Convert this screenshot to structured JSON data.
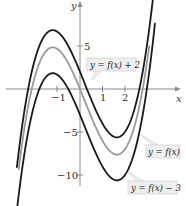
{
  "chart_data": {
    "type": "line",
    "title": "",
    "xlabel": "x",
    "ylabel": "y",
    "xlim": [
      -3.5,
      4.2
    ],
    "ylim": [
      -12.9,
      10.4
    ],
    "grid": false,
    "x_ticks": [
      {
        "value": -1,
        "label": "−1"
      },
      {
        "value": 1,
        "label": "1"
      },
      {
        "value": 2,
        "label": "2"
      }
    ],
    "y_ticks": [
      {
        "value": 5,
        "label": "5"
      },
      {
        "value": -5,
        "label": "−5"
      },
      {
        "value": -10,
        "label": "−10"
      }
    ],
    "base_function": {
      "description": "cubic f(x) ≈ 1.1x³ − 0.7x² − 6.46x (local max ≈ 4.8 at x ≈ −1.1, local min ≈ −7.8 at x ≈ 1.6)",
      "coefficients": {
        "a3": 1.1,
        "a2": -0.7,
        "a1": -6.46,
        "a0": 0
      }
    },
    "series": [
      {
        "name": "y = f(x) + 2",
        "shift": 2,
        "color": "#1a1a1a",
        "stroke_width": 1.8,
        "domain": [
          -2.78,
          3.26
        ],
        "points": [
          [
            -2.78,
            -8.9
          ],
          [
            -2.5,
            -4.3
          ],
          [
            -2,
            0.8
          ],
          [
            -1.5,
            5.0
          ],
          [
            -1.1,
            6.8
          ],
          [
            -0.5,
            5.1
          ],
          [
            0,
            2.0
          ],
          [
            0.5,
            -1.2
          ],
          [
            1,
            -4.1
          ],
          [
            1.6,
            -5.8
          ],
          [
            2,
            -5.0
          ],
          [
            2.5,
            -1.3
          ],
          [
            3,
            5.1
          ],
          [
            3.26,
            10.1
          ]
        ]
      },
      {
        "name": "y = f(x)",
        "shift": 0,
        "color": "#9a9a9a",
        "stroke_width": 1.8,
        "domain": [
          -2.7,
          3.05
        ],
        "points": [
          [
            -2.7,
            -9.7
          ],
          [
            -2.5,
            -6.3
          ],
          [
            -2,
            -1.2
          ],
          [
            -1.5,
            3.0
          ],
          [
            -1.1,
            4.8
          ],
          [
            -0.5,
            3.1
          ],
          [
            0,
            0
          ],
          [
            0.5,
            -3.2
          ],
          [
            1,
            -6.1
          ],
          [
            1.6,
            -7.8
          ],
          [
            2,
            -7.0
          ],
          [
            2.5,
            -3.3
          ],
          [
            3,
            3.1
          ]
        ]
      },
      {
        "name": "y = f(x) − 3",
        "shift": -3,
        "color": "#1a1a1a",
        "stroke_width": 1.8,
        "domain": [
          -2.78,
          3.3
        ],
        "points": [
          [
            -2.78,
            -13.9
          ],
          [
            -2.5,
            -9.3
          ],
          [
            -2,
            -4.2
          ],
          [
            -1.5,
            0.0
          ],
          [
            -1.1,
            1.8
          ],
          [
            -0.5,
            0.1
          ],
          [
            0,
            -3.0
          ],
          [
            0.5,
            -6.2
          ],
          [
            1,
            -9.1
          ],
          [
            1.6,
            -10.8
          ],
          [
            2,
            -10.0
          ],
          [
            2.5,
            -6.3
          ],
          [
            3,
            0.1
          ],
          [
            3.3,
            5.6
          ]
        ]
      }
    ],
    "annotations": [
      {
        "text": "y = f(x) + 2",
        "series": 0
      },
      {
        "text": "y = f(x)",
        "series": 1
      },
      {
        "text": "y = f(x) − 3",
        "series": 2
      }
    ]
  }
}
